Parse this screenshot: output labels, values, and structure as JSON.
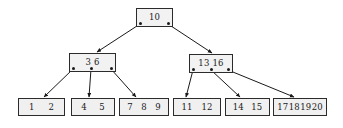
{
  "figure": {
    "background_color": "#ffffff",
    "node_fill_color": "#f2f2f2",
    "node_border_color": "#2b2b2b",
    "edge_color": "#1a1a1a",
    "text_color": "#1a1a1a"
  },
  "tree": {
    "root": {
      "label": "root-node",
      "keys": [
        "10"
      ],
      "box": {
        "x": 136,
        "y": 8,
        "w": 37,
        "h": 19
      },
      "pointers": [
        {
          "name": "root-pointer-left",
          "x": 140,
          "y": 23
        },
        {
          "name": "root-pointer-right",
          "x": 168,
          "y": 23
        }
      ]
    },
    "internal": [
      {
        "label": "internal-node-left",
        "keys": [
          "3",
          "6"
        ],
        "box": {
          "x": 69,
          "y": 53,
          "w": 47,
          "h": 19
        },
        "pointers": [
          {
            "name": "left-internal-pointer-1",
            "x": 73,
            "y": 68
          },
          {
            "name": "left-internal-pointer-2",
            "x": 91,
            "y": 68
          },
          {
            "name": "left-internal-pointer-3",
            "x": 111,
            "y": 68
          }
        ]
      },
      {
        "label": "internal-node-right",
        "keys": [
          "13",
          "16"
        ],
        "box": {
          "x": 189,
          "y": 54,
          "w": 44,
          "h": 19
        },
        "pointers": [
          {
            "name": "right-internal-pointer-1",
            "x": 193,
            "y": 69
          },
          {
            "name": "right-internal-pointer-2",
            "x": 211,
            "y": 69
          },
          {
            "name": "right-internal-pointer-3",
            "x": 228,
            "y": 69
          }
        ]
      }
    ],
    "leaves": [
      {
        "label": "leaf-node-1",
        "keys": [
          "1",
          "2"
        ],
        "box": {
          "x": 18,
          "y": 98,
          "w": 47,
          "h": 18
        }
      },
      {
        "label": "leaf-node-2",
        "keys": [
          "4",
          "5"
        ],
        "box": {
          "x": 71,
          "y": 98,
          "w": 44,
          "h": 18
        }
      },
      {
        "label": "leaf-node-3",
        "keys": [
          "7",
          "8",
          "9"
        ],
        "box": {
          "x": 119,
          "y": 98,
          "w": 50,
          "h": 18
        }
      },
      {
        "label": "leaf-node-4",
        "keys": [
          "11",
          "12"
        ],
        "box": {
          "x": 173,
          "y": 98,
          "w": 48,
          "h": 18
        }
      },
      {
        "label": "leaf-node-5",
        "keys": [
          "14",
          "15"
        ],
        "box": {
          "x": 225,
          "y": 98,
          "w": 45,
          "h": 18
        }
      },
      {
        "label": "leaf-node-6",
        "keys": [
          "17",
          "18",
          "19",
          "20"
        ],
        "box": {
          "x": 273,
          "y": 98,
          "w": 54,
          "h": 18
        }
      }
    ],
    "edges": [
      {
        "name": "edge-root-to-left-internal",
        "from": [
          140,
          24
        ],
        "to": [
          97,
          52
        ]
      },
      {
        "name": "edge-root-to-right-internal",
        "from": [
          168,
          24
        ],
        "to": [
          212,
          53
        ]
      },
      {
        "name": "edge-left-internal-to-leaf-1",
        "from": [
          73,
          69
        ],
        "to": [
          44,
          97
        ]
      },
      {
        "name": "edge-left-internal-to-leaf-2",
        "from": [
          91,
          69
        ],
        "to": [
          89,
          97
        ]
      },
      {
        "name": "edge-left-internal-to-leaf-3",
        "from": [
          111,
          69
        ],
        "to": [
          136,
          97
        ]
      },
      {
        "name": "edge-right-internal-to-leaf-4",
        "from": [
          193,
          70
        ],
        "to": [
          186,
          97
        ]
      },
      {
        "name": "edge-right-internal-to-leaf-5",
        "from": [
          211,
          70
        ],
        "to": [
          240,
          97
        ]
      },
      {
        "name": "edge-right-internal-to-leaf-6",
        "from": [
          228,
          70
        ],
        "to": [
          294,
          97
        ]
      }
    ]
  }
}
